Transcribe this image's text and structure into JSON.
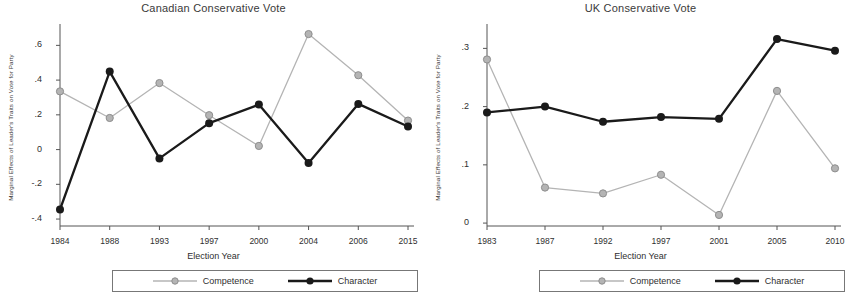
{
  "figure": {
    "legend": {
      "competence_label": "Competence",
      "character_label": "Character",
      "competence_color": "#b4b4b4",
      "character_color": "#1a1a1a"
    }
  },
  "chart_data": [
    {
      "type": "line",
      "panel": "left",
      "title": "Canadian Conservative Vote",
      "xlabel": "Election Year",
      "ylabel": "Marginal Effects of Leader's Traits on Vote for Party",
      "categories": [
        "1984",
        "1988",
        "1993",
        "1997",
        "2000",
        "2004",
        "2006",
        "2015"
      ],
      "yticks": [
        ".6",
        ".4",
        ".2",
        "0",
        "-.2",
        "-.4"
      ],
      "ytick_values": [
        0.6,
        0.4,
        0.2,
        0,
        -0.2,
        -0.4
      ],
      "ylim": [
        -0.44,
        0.7
      ],
      "grid": false,
      "legend_position": "bottom",
      "series": [
        {
          "name": "Competence",
          "color": "#b4b4b4",
          "values": [
            0.335,
            0.182,
            0.383,
            0.198,
            0.021,
            0.665,
            0.428,
            0.167
          ]
        },
        {
          "name": "Character",
          "color": "#1a1a1a",
          "values": [
            -0.345,
            0.449,
            -0.051,
            0.152,
            0.259,
            -0.077,
            0.263,
            0.133
          ]
        }
      ]
    },
    {
      "type": "line",
      "panel": "right",
      "title": "UK Conservative Vote",
      "xlabel": "Election Year",
      "ylabel": "Marginal Effects of Leader's Traits on Vote for Party",
      "categories": [
        "1983",
        "1987",
        "1992",
        "1997",
        "2001",
        "2005",
        "2010"
      ],
      "yticks": [
        ".3",
        ".2",
        ".1",
        "0"
      ],
      "ytick_values": [
        0.3,
        0.2,
        0.1,
        0
      ],
      "ylim": [
        -0.005,
        0.335
      ],
      "grid": false,
      "legend_position": "bottom",
      "series": [
        {
          "name": "Competence",
          "color": "#b4b4b4",
          "values": [
            0.281,
            0.061,
            0.051,
            0.083,
            0.014,
            0.227,
            0.094
          ]
        },
        {
          "name": "Character",
          "color": "#1a1a1a",
          "values": [
            0.19,
            0.2,
            0.174,
            0.182,
            0.179,
            0.316,
            0.296
          ]
        }
      ]
    }
  ]
}
